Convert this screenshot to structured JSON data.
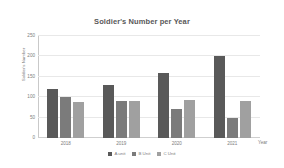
{
  "chart_data": {
    "type": "bar",
    "title": "Soldier's Number per Year",
    "xlabel": "Year",
    "ylabel": "Soldier's Number",
    "categories": [
      "2018",
      "2019",
      "2020",
      "2021"
    ],
    "series": [
      {
        "name": "A unit",
        "values": [
          120,
          130,
          160,
          200
        ],
        "color": "#595959"
      },
      {
        "name": "B Unit",
        "values": [
          100,
          90,
          70,
          50
        ],
        "color": "#7b7b7b"
      },
      {
        "name": "C Unit",
        "values": [
          88,
          90,
          92,
          90
        ],
        "color": "#a0a0a0"
      }
    ],
    "ylim": [
      0,
      250
    ],
    "yticks": [
      0,
      50,
      100,
      150,
      200,
      250
    ],
    "ytick_labels": [
      "0",
      "50",
      "100",
      "150",
      "200",
      "250"
    ],
    "grid": true,
    "legend_position": "bottom"
  },
  "colors": {
    "background": "#ffffff",
    "gridline": "#e8e8e8",
    "axis": "#c9c9c9",
    "text": "#7d7d7d",
    "title_text": "#585858"
  }
}
